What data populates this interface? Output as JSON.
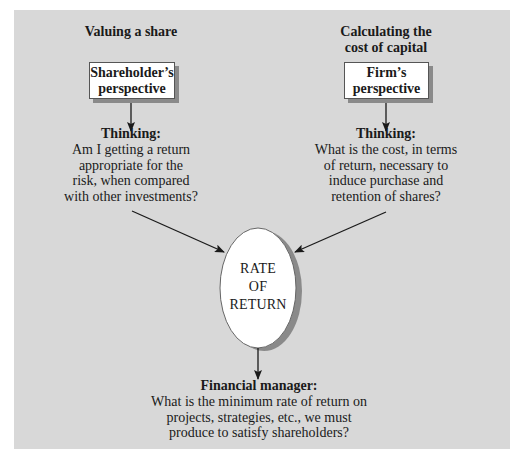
{
  "diagram": {
    "colors": {
      "panel_background": "#d8d8d8",
      "box_fill": "#ffffff",
      "box_shadow": "#8a8a8a",
      "line": "#1a1a1a"
    },
    "left_column": {
      "title": "Valuing a share",
      "box_lines": [
        "Shareholder’s",
        "perspective"
      ],
      "thinking_heading": "Thinking:",
      "thinking_lines": [
        "Am I getting a return",
        "appropriate for the",
        "risk, when compared",
        "with other investments?"
      ]
    },
    "right_column": {
      "title_lines": [
        "Calculating the",
        "cost of capital"
      ],
      "box_lines": [
        "Firm’s",
        "perspective"
      ],
      "thinking_heading": "Thinking:",
      "thinking_lines": [
        "What is the cost, in terms",
        "of return, necessary to",
        "induce purchase and",
        "retention of shares?"
      ]
    },
    "center": {
      "ellipse_lines": [
        "RATE",
        "OF",
        "RETURN"
      ]
    },
    "bottom": {
      "heading": "Financial manager:",
      "lines": [
        "What is the minimum rate of return on",
        "projects, strategies, etc., we must",
        "produce to satisfy shareholders?"
      ]
    }
  }
}
